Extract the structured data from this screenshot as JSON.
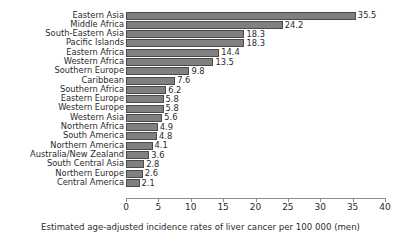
{
  "chart_data": {
    "type": "bar",
    "orientation": "horizontal",
    "title": "",
    "xlabel": "Estimated age-adjusted incidence rates of liver cancer per 100 000 (men)",
    "ylabel": "",
    "xlim": [
      0,
      40
    ],
    "xticks": [
      0,
      5,
      10,
      15,
      20,
      25,
      30,
      35,
      40
    ],
    "grid": false,
    "legend": false,
    "show_value_labels": true,
    "bar_color": "#808080",
    "bar_edge_color": "#4a4a4a",
    "background_color": "#ffffff",
    "text_color": "#2b2b2b",
    "categories": [
      "Eastern Asia",
      "Middle Africa",
      "South-Eastern Asia",
      "Pacific Islands",
      "Eastern Africa",
      "Western Africa",
      "Southern Europe",
      "Caribbean",
      "Southern Africa",
      "Eastern Europe",
      "Western Europe",
      "Western Asia",
      "Northern Africa",
      "South America",
      "Northern America",
      "Australia/New Zealand",
      "South Central Asia",
      "Northern Europe",
      "Central America"
    ],
    "values": [
      35.5,
      24.2,
      18.3,
      18.3,
      14.4,
      13.5,
      9.8,
      7.6,
      6.2,
      5.8,
      5.8,
      5.6,
      4.9,
      4.8,
      4.1,
      3.6,
      2.8,
      2.6,
      2.1
    ],
    "value_labels": [
      "35.5",
      "24.2",
      "18.3",
      "18.3",
      "14.4",
      "13.5",
      "9.8",
      "7.6",
      "6.2",
      "5.8",
      "5.8",
      "5.6",
      "4.9",
      "4.8",
      "4.1",
      "3.6",
      "2.8",
      "2.6",
      "2.1"
    ]
  }
}
